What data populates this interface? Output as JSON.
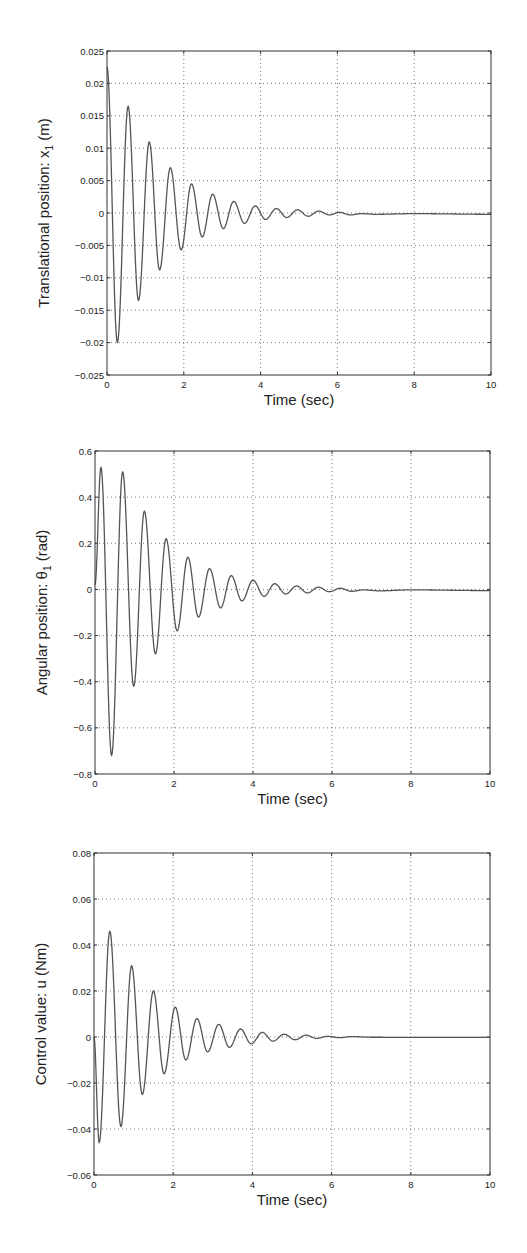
{
  "chart_data": [
    {
      "type": "line",
      "title": "",
      "xlabel": "Time (sec)",
      "ylabel": "Translational position: x_1 (m)",
      "ylabel_main": "Translational position: x",
      "ylabel_sub": "1",
      "ylabel_unit": " (m)",
      "xlim": [
        0,
        10
      ],
      "ylim": [
        -0.025,
        0.025
      ],
      "xticks": [
        0,
        2,
        4,
        6,
        8,
        10
      ],
      "xtick_labels": [
        "0",
        "2",
        "4",
        "6",
        "8",
        "10"
      ],
      "yticks": [
        -0.025,
        -0.02,
        -0.015,
        -0.01,
        -0.005,
        0,
        0.005,
        0.01,
        0.015,
        0.02,
        0.025
      ],
      "ytick_labels": [
        "−0.025",
        "−0.02",
        "−0.015",
        "−0.01",
        "−0.005",
        "0",
        "0.005",
        "0.01",
        "0.015",
        "0.02",
        "0.025"
      ],
      "grid": true,
      "legend": null,
      "series": [
        {
          "name": "x1",
          "color": "#555555",
          "extrema": [
            [
              0,
              0.0225
            ],
            [
              0.27,
              -0.02
            ],
            [
              0.55,
              0.0165
            ],
            [
              0.82,
              -0.0135
            ],
            [
              1.1,
              0.011
            ],
            [
              1.37,
              -0.0088
            ],
            [
              1.65,
              0.007
            ],
            [
              1.93,
              -0.0057
            ],
            [
              2.2,
              0.0045
            ],
            [
              2.48,
              -0.0037
            ],
            [
              2.75,
              0.0029
            ],
            [
              3.03,
              -0.0024
            ],
            [
              3.3,
              0.0018
            ],
            [
              3.58,
              -0.0016
            ],
            [
              3.86,
              0.0011
            ],
            [
              4.13,
              -0.001
            ],
            [
              4.41,
              0.0007
            ],
            [
              4.68,
              -0.0007
            ],
            [
              4.96,
              0.0005
            ],
            [
              5.24,
              -0.0005
            ],
            [
              5.51,
              0.0003
            ],
            [
              5.79,
              -0.0003
            ],
            [
              6.06,
              0.0001
            ],
            [
              6.34,
              -0.0003
            ],
            [
              6.62,
              -0.0001
            ],
            [
              7.0,
              -0.0002
            ],
            [
              8.0,
              -0.0001
            ],
            [
              10.0,
              -0.0002
            ]
          ]
        }
      ]
    },
    {
      "type": "line",
      "title": "",
      "xlabel": "Time (sec)",
      "ylabel": "Angular position: θ_1 (rad)",
      "ylabel_main": "Angular position: θ",
      "ylabel_sub": "1",
      "ylabel_unit": " (rad)",
      "xlim": [
        0,
        10
      ],
      "ylim": [
        -0.8,
        0.6
      ],
      "xticks": [
        0,
        2,
        4,
        6,
        8,
        10
      ],
      "xtick_labels": [
        "0",
        "2",
        "4",
        "6",
        "8",
        "10"
      ],
      "yticks": [
        -0.8,
        -0.6,
        -0.4,
        -0.2,
        0,
        0.2,
        0.4,
        0.6
      ],
      "ytick_labels": [
        "−0.8",
        "−0.6",
        "−0.4",
        "−0.2",
        "0",
        "0.2",
        "0.4",
        "0.6"
      ],
      "grid": true,
      "legend": null,
      "series": [
        {
          "name": "theta1",
          "color": "#555555",
          "extrema": [
            [
              0,
              0.02
            ],
            [
              0.15,
              0.53
            ],
            [
              0.42,
              -0.72
            ],
            [
              0.7,
              0.51
            ],
            [
              0.98,
              -0.42
            ],
            [
              1.25,
              0.34
            ],
            [
              1.53,
              -0.28
            ],
            [
              1.8,
              0.22
            ],
            [
              2.08,
              -0.18
            ],
            [
              2.35,
              0.14
            ],
            [
              2.62,
              -0.12
            ],
            [
              2.9,
              0.09
            ],
            [
              3.18,
              -0.08
            ],
            [
              3.45,
              0.06
            ],
            [
              3.72,
              -0.05
            ],
            [
              4.0,
              0.04
            ],
            [
              4.28,
              -0.03
            ],
            [
              4.55,
              0.025
            ],
            [
              4.83,
              -0.02
            ],
            [
              5.1,
              0.015
            ],
            [
              5.38,
              -0.015
            ],
            [
              5.66,
              0.01
            ],
            [
              5.93,
              -0.01
            ],
            [
              6.21,
              0.005
            ],
            [
              6.49,
              -0.008
            ],
            [
              6.8,
              -0.002
            ],
            [
              7.2,
              -0.006
            ],
            [
              8.0,
              -0.002
            ],
            [
              10.0,
              -0.005
            ]
          ]
        }
      ]
    },
    {
      "type": "line",
      "title": "",
      "xlabel": "Time (sec)",
      "ylabel": "Control value: u (Nm)",
      "ylabel_main": "Control value: u (Nm)",
      "ylabel_sub": "",
      "ylabel_unit": "",
      "xlim": [
        0,
        10
      ],
      "ylim": [
        -0.06,
        0.08
      ],
      "xticks": [
        0,
        2,
        4,
        6,
        8,
        10
      ],
      "xtick_labels": [
        "0",
        "2",
        "4",
        "6",
        "8",
        "10"
      ],
      "yticks": [
        -0.06,
        -0.04,
        -0.02,
        0,
        0.02,
        0.04,
        0.06,
        0.08
      ],
      "ytick_labels": [
        "−0.06",
        "−0.04",
        "−0.02",
        "0",
        "0.02",
        "0.04",
        "0.06",
        "0.08"
      ],
      "grid": true,
      "legend": null,
      "series": [
        {
          "name": "u",
          "color": "#555555",
          "extrema": [
            [
              0,
              0.0
            ],
            [
              0.13,
              -0.046
            ],
            [
              0.4,
              0.046
            ],
            [
              0.68,
              -0.039
            ],
            [
              0.95,
              0.031
            ],
            [
              1.22,
              -0.025
            ],
            [
              1.5,
              0.02
            ],
            [
              1.77,
              -0.016
            ],
            [
              2.05,
              0.013
            ],
            [
              2.32,
              -0.01
            ],
            [
              2.6,
              0.008
            ],
            [
              2.87,
              -0.0065
            ],
            [
              3.15,
              0.0055
            ],
            [
              3.42,
              -0.0045
            ],
            [
              3.7,
              0.0035
            ],
            [
              3.97,
              -0.003
            ],
            [
              4.25,
              0.002
            ],
            [
              4.52,
              -0.0018
            ],
            [
              4.8,
              0.0012
            ],
            [
              5.08,
              -0.0012
            ],
            [
              5.35,
              0.0008
            ],
            [
              5.62,
              -0.0006
            ],
            [
              5.9,
              0.0003
            ],
            [
              6.2,
              -0.0003
            ],
            [
              6.5,
              0.0002
            ],
            [
              7.0,
              -0.0001
            ],
            [
              8.0,
              -0.0002
            ],
            [
              10.0,
              -0.0002
            ]
          ]
        }
      ]
    }
  ],
  "layout": {
    "panels": [
      {
        "left": 107,
        "top": 51,
        "right": 491,
        "bottom": 375
      },
      {
        "left": 95,
        "top": 451,
        "right": 490,
        "bottom": 774
      },
      {
        "left": 94,
        "top": 853,
        "right": 490,
        "bottom": 1175
      }
    ]
  }
}
